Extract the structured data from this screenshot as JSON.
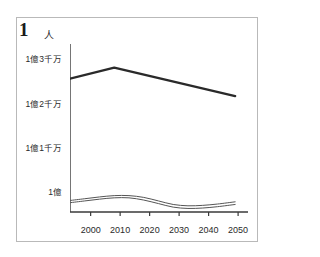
{
  "figure": {
    "number_label": "1",
    "unit_label": "人"
  },
  "chart_data": {
    "type": "line",
    "title": "",
    "subtitle": "",
    "xlabel": "",
    "ylabel": "人",
    "grid": false,
    "legend": "none",
    "xlim": [
      1993,
      2052
    ],
    "ylim": [
      95500000,
      133000000
    ],
    "x_ticks": [
      2000,
      2010,
      2020,
      2030,
      2040,
      2050
    ],
    "x_tick_labels": [
      "2000",
      "2010",
      "2020",
      "2030",
      "2040",
      "2050"
    ],
    "y_ticks": [
      100000000,
      110000000,
      120000000,
      130000000
    ],
    "y_tick_labels": [
      "1億",
      "1億1千万",
      "1億2千万",
      "1億3千万"
    ],
    "series": [
      {
        "name": "総人口",
        "style": "thick",
        "x": [
          1993,
          2008,
          2049
        ],
        "values": [
          125600000,
          128100000,
          121700000
        ]
      },
      {
        "name": "上位推計",
        "style": "thin",
        "x": [
          1993,
          1998,
          2003,
          2008,
          2013,
          2018,
          2023,
          2028,
          2033,
          2038,
          2043,
          2049
        ],
        "values": [
          98100000,
          98500000,
          98900000,
          99200000,
          99200000,
          98800000,
          98000000,
          97200000,
          96900000,
          97000000,
          97300000,
          97800000
        ]
      },
      {
        "name": "下位推計",
        "style": "thin",
        "x": [
          1993,
          1998,
          2003,
          2008,
          2013,
          2018,
          2023,
          2028,
          2033,
          2038,
          2043,
          2049
        ],
        "values": [
          97600000,
          98000000,
          98400000,
          98700000,
          98700000,
          98200000,
          97400000,
          96600000,
          96300000,
          96400000,
          96700000,
          97200000
        ]
      }
    ]
  },
  "colors": {
    "frame": "#b9b9b9",
    "axis": "#3a3a3a",
    "line_thick": "#2a2a2a",
    "line_thin": "#555555",
    "text": "#2a2a2a"
  }
}
